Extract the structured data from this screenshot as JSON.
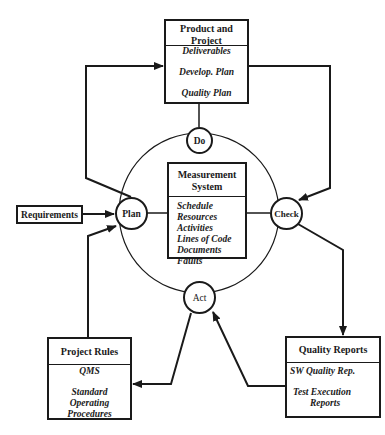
{
  "diagram": {
    "colors": {
      "line": "#1a1a1a",
      "background": "#ffffff"
    },
    "nodes": {
      "do": {
        "label": "Do"
      },
      "plan": {
        "label": "Plan"
      },
      "check": {
        "label": "Check"
      },
      "act": {
        "label": "Act"
      }
    },
    "boxes": {
      "product": {
        "title_line1": "Product and",
        "title_line2": "Project",
        "items": [
          "Deliverables",
          "Develop. Plan",
          "Quality Plan"
        ]
      },
      "measurement": {
        "title_line1": "Measurement",
        "title_line2": "System",
        "items": [
          "Schedule",
          "Resources",
          "Activities",
          "Lines of Code",
          "Documents",
          "Faults"
        ]
      },
      "requirements": {
        "title": "Requirements"
      },
      "project_rules": {
        "title": "Project Rules",
        "items": [
          "QMS",
          "Standard",
          "Operating",
          "Procedures"
        ]
      },
      "quality_reports": {
        "title": "Quality Reports",
        "items": [
          "SW Quality Rep.",
          "Test Execution",
          "Reports"
        ]
      }
    }
  }
}
